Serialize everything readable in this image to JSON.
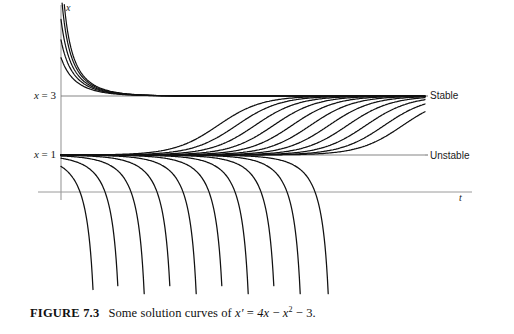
{
  "figure": {
    "caption_number": "FIGURE 7.3",
    "caption_text": "Some solution curves of",
    "equation": {
      "lhs": "x",
      "prime": "′",
      "equals": "=",
      "term1": "4x",
      "minus1": "−",
      "term2": "x",
      "exponent": "2",
      "minus2": "−",
      "term3": "3",
      "period": ".",
      "plain": "x′ = 4x − x² − 3."
    },
    "background_color": "#ffffff",
    "curve_color": "#111111",
    "axis_color": "#9a9a9a"
  },
  "axes": {
    "vertical_label": "x",
    "horizontal_label": "t",
    "vertical_axis": {
      "x": 61,
      "y_top": 5,
      "y_bottom": 200
    },
    "horizontal_axis": {
      "y": 192,
      "x_left": 38,
      "x_right": 472
    }
  },
  "equilibria": [
    {
      "name": "stable-equilibrium",
      "label": "x = 3",
      "label_var": "x",
      "label_rest": " = 3",
      "value": 3,
      "pixel_y": 96,
      "annotation": "Stable",
      "line_x_start": 61,
      "line_x_end": 425
    },
    {
      "name": "unstable-equilibrium",
      "label": "x = 1",
      "label_var": "x",
      "label_rest": " = 1",
      "value": 1,
      "pixel_y": 155,
      "annotation": "Unstable",
      "line_x_start": 61,
      "line_x_end": 425
    }
  ],
  "chart_data": {
    "type": "line",
    "xlabel": "t",
    "ylabel": "x",
    "grid": false,
    "legend": "none",
    "equation": "x' = 4x - x^2 - 3 = -(x-1)(x-3)",
    "xlim": [
      0,
      10
    ],
    "ylim": [
      -6,
      8
    ],
    "equilibria": {
      "stable": 3,
      "unstable": 1
    },
    "annotations": [
      {
        "text": "Stable",
        "x": 9.0,
        "y": 3
      },
      {
        "text": "Unstable",
        "x": 9.0,
        "y": 1
      }
    ],
    "families": [
      {
        "name": "above-stable-decaying",
        "description": "Curves starting above x=3 that decay down onto the stable equilibrium x=3",
        "initial_values": [
          7.8,
          6.6,
          5.6,
          4.9,
          4.3
        ],
        "asymptote": 3
      },
      {
        "name": "between-equilibria-rising",
        "description": "Curves starting just above x=1 that rise toward the stable equilibrium x=3, shifted progressively right",
        "time_shifts": [
          0.0,
          0.42,
          0.84,
          1.26,
          1.68,
          2.1,
          2.52,
          2.94,
          3.36,
          3.78,
          4.2
        ],
        "asymptote_low": 1,
        "asymptote_high": 3
      },
      {
        "name": "below-unstable-diverging",
        "description": "Curves starting just below x=1 that fall away to minus infinity in finite time, shifted progressively right",
        "blowup_positions_px": [
          85,
          110,
          136,
          162,
          188,
          214,
          240,
          266,
          292,
          320
        ],
        "count": 10
      }
    ]
  }
}
